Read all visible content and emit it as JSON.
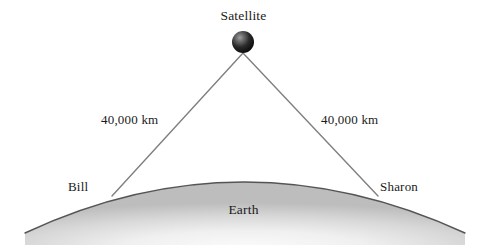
{
  "diagram": {
    "background_color": "#ffffff",
    "labels": {
      "satellite": "Satellite",
      "distance_left": "40,000 km",
      "distance_right": "40,000 km",
      "observer_left": "Bill",
      "observer_right": "Sharon",
      "earth": "Earth"
    },
    "colors": {
      "line": "#808080",
      "text": "#1a1a1a",
      "satellite_dark": "#111111",
      "satellite_highlight": "#b4b4b4",
      "earth_outline": "#555555",
      "earth_fill_light": "#f2f2f2",
      "earth_fill_dark": "#bfbfbf"
    },
    "geometry": {
      "satellite_center_x": 243,
      "satellite_center_y": 42,
      "satellite_radius": 11,
      "observer_left_x": 112,
      "observer_left_y": 196,
      "observer_right_x": 378,
      "observer_right_y": 196,
      "earth_left_x": 25,
      "earth_right_x": 465,
      "earth_baseline_y": 233,
      "earth_apex_y": 182
    }
  }
}
